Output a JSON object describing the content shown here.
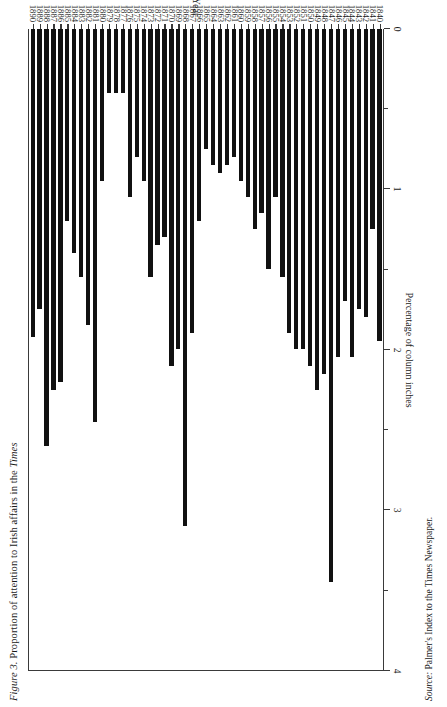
{
  "figure": {
    "title_prefix": "Figure 3.",
    "title_rest": " Proportion of attention to Irish affairs in the ",
    "title_emph": "Times",
    "source_prefix": "Source:",
    "source_rest": " Palmer's Index to the Times Newspaper."
  },
  "chart_data": {
    "type": "bar",
    "orientation": "horizontal",
    "title": "Figure 3. Proportion of attention to Irish affairs in the Times",
    "xlabel": "Percentage of column inches",
    "ylabel": "Year",
    "xlim": [
      0,
      4
    ],
    "xticks": [
      0,
      1,
      2,
      3,
      4
    ],
    "xtick_labels": [
      "0",
      "1",
      "2",
      "3",
      "4"
    ],
    "minor_tick_step": 0.5,
    "grid": false,
    "legend": null,
    "bar_color": "#111111",
    "axis_color": "#3a3a3a",
    "categories": [
      "1840",
      "1841",
      "1842",
      "1843",
      "1844",
      "1845",
      "1846",
      "1847",
      "1848",
      "1849",
      "1850",
      "1851",
      "1852",
      "1853",
      "1854",
      "1855",
      "1856",
      "1857",
      "1858",
      "1859",
      "1860",
      "1861",
      "1862",
      "1863",
      "1864",
      "1865",
      "1866",
      "1867",
      "1868",
      "1869",
      "1870",
      "1871",
      "1872",
      "1873",
      "1874",
      "1875",
      "1876",
      "1877",
      "1878",
      "1879",
      "1880",
      "1881",
      "1882",
      "1883",
      "1884",
      "1885",
      "1886",
      "1887",
      "1888",
      "1889",
      "1890"
    ],
    "values": [
      1.95,
      1.25,
      1.8,
      1.75,
      2.05,
      1.7,
      2.05,
      3.45,
      2.15,
      2.25,
      2.1,
      2.0,
      2.0,
      1.9,
      1.55,
      1.05,
      1.5,
      1.15,
      1.25,
      1.05,
      0.95,
      0.8,
      0.85,
      0.9,
      0.85,
      0.75,
      1.2,
      1.9,
      3.1,
      2.0,
      2.1,
      1.3,
      1.35,
      1.55,
      0.95,
      0.8,
      1.05,
      0.4,
      0.4,
      0.4,
      0.95,
      2.45,
      1.85,
      1.55,
      1.4,
      1.2,
      2.2,
      2.25,
      2.6,
      1.75,
      1.92
    ]
  }
}
